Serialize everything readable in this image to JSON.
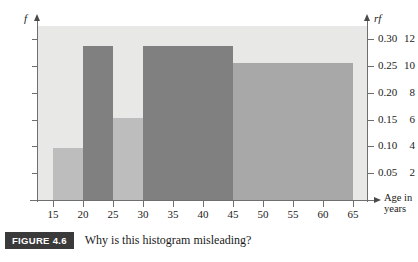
{
  "figure": {
    "badge_label": "FIGURE 4.6",
    "caption": "Why is this histogram misleading?"
  },
  "axes": {
    "left_title": "f",
    "right_title": "rf",
    "x_title": "Age in\nyears",
    "x_title_line1": "Age in",
    "x_title_line2": "years"
  },
  "colors": {
    "plot_background": "#e8e8e6",
    "bar_light": "#bdbdbd",
    "bar_dark": "#808080",
    "bar_medium": "#a8a8a8",
    "axis": "#6f6f6f",
    "text": "#1a1a1a",
    "badge_background": "#3a3a3a",
    "badge_text": "#ffffff"
  },
  "chart_data": {
    "type": "bar",
    "title": "Why is this histogram misleading?",
    "xlabel": "Age in years",
    "ylabel": "f",
    "y2label": "rf",
    "grid": false,
    "legend": "none",
    "xlim": [
      12.5,
      67.5
    ],
    "ylim": [
      0,
      13
    ],
    "y2lim": [
      0,
      0.325
    ],
    "xticks": [
      15,
      20,
      25,
      30,
      35,
      40,
      45,
      50,
      55,
      60,
      65
    ],
    "xtick_labels": [
      "15",
      "20",
      "25",
      "30",
      "35",
      "40",
      "45",
      "50",
      "55",
      "60",
      "65"
    ],
    "yticks": [
      2,
      4,
      6,
      8,
      10,
      12
    ],
    "ytick_labels": [
      "2",
      "4",
      "6",
      "8",
      "10",
      "12"
    ],
    "y2ticks": [
      0.05,
      0.1,
      0.15,
      0.2,
      0.25,
      0.3
    ],
    "y2tick_labels": [
      "0.05",
      "0.10",
      "0.15",
      "0.20",
      "0.25",
      "0.30"
    ],
    "bins": [
      {
        "label": "15-20",
        "start": 15,
        "end": 20,
        "frequency": 3.9,
        "relative_frequency": 0.0975,
        "color": "#bdbdbd"
      },
      {
        "label": "20-25",
        "start": 20,
        "end": 25,
        "frequency": 11.5,
        "relative_frequency": 0.2875,
        "color": "#808080"
      },
      {
        "label": "25-30",
        "start": 25,
        "end": 30,
        "frequency": 6.1,
        "relative_frequency": 0.1525,
        "color": "#bdbdbd"
      },
      {
        "label": "30-45",
        "start": 30,
        "end": 45,
        "frequency": 11.5,
        "relative_frequency": 0.2875,
        "color": "#808080"
      },
      {
        "label": "45-65",
        "start": 45,
        "end": 65,
        "frequency": 10.25,
        "relative_frequency": 0.2563,
        "color": "#a8a8a8"
      }
    ],
    "categories": [
      "15-20",
      "20-25",
      "25-30",
      "30-45",
      "45-65"
    ],
    "values": [
      3.9,
      11.5,
      6.1,
      11.5,
      10.25
    ]
  }
}
